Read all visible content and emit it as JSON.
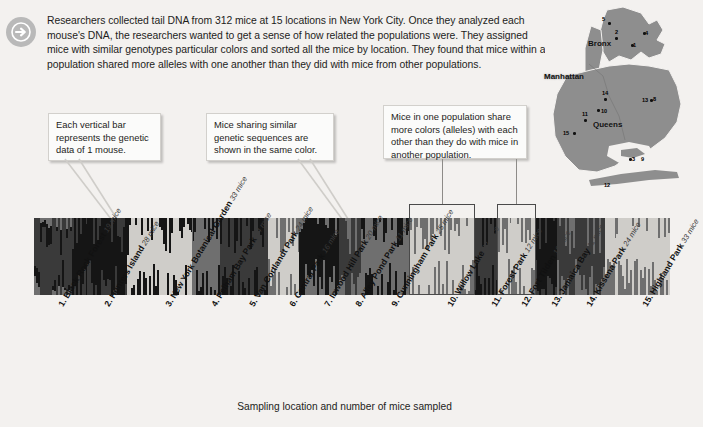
{
  "intro": {
    "icon": "arrow-right-circle-icon",
    "text": "Researchers collected tail DNA from 312 mice at 15 locations in New York City. Once they analyzed each mouse's DNA, the researchers wanted to get a sense of how related the populations were. They assigned mice with similar genotypes particular colors and sorted all the mice by location. They found that mice within a population shared more alleles with one another than they did with mice from other populations."
  },
  "callouts": [
    {
      "id": "callout-vertical-bar",
      "text": "Each vertical bar represents the genetic data of 1 mouse."
    },
    {
      "id": "callout-same-color",
      "text": "Mice sharing similar genetic sequences are shown in the same color."
    },
    {
      "id": "callout-shared-alleles",
      "text": "Mice in one population share more colors (alleles) with each other than they do with mice in another population."
    }
  ],
  "map": {
    "name": "new-york-city-map",
    "boroughs": [
      "Bronx",
      "Manhattan",
      "Queens"
    ],
    "markers": [
      "5",
      "2",
      "4",
      "1",
      "14",
      "13",
      "8",
      "10",
      "11",
      "15",
      "9",
      "3",
      "12"
    ]
  },
  "axis": {
    "caption": "Sampling location and number of mice sampled"
  },
  "chart_data": {
    "type": "bar",
    "title": "",
    "subtitle": "",
    "xlabel": "Sampling location and number of mice sampled",
    "ylabel": "",
    "total_mice": 312,
    "locations_count": 15,
    "categories": [
      "1. Black Rock Forest",
      "2. Hunters Island",
      "3. New York Botanical Garden",
      "4. Pelham Bay Park",
      "5. Van Cortlandt Park",
      "6. Central Park",
      "7. Inwood Hill Park",
      "8. Alley Pond Park",
      "9. Cunningham Park",
      "10. Willow Lake",
      "11. Forest Park",
      "12. Fort Tilden",
      "13. Jamaica Bay",
      "14. Kissena Park",
      "15. Highland Park"
    ],
    "values": [
      19,
      28,
      33,
      14,
      24,
      16,
      20,
      11,
      25,
      32,
      12,
      19,
      11,
      24,
      33
    ],
    "value_labels": [
      "19 mice",
      "28 mice",
      "33 mice",
      "14 mice",
      "24 mice",
      "16 mice",
      "20 mice",
      "11 mice",
      "25 mice",
      "32 mice",
      "12 mice",
      "19 mice",
      "11 mice",
      "24 mice",
      "33 mice"
    ],
    "unit": "mice",
    "grid": false,
    "legend": "none",
    "note": "STRUCTURE-style admixture plot: each category is a population block of vertical bars, one bar per mouse; bar segments are ancestry-cluster colors",
    "palette": [
      "#cfcdc9",
      "#6f6f6f",
      "#3a3a3a",
      "#151515"
    ],
    "highlighted_populations": [
      "10. Willow Lake",
      "12. Fort Tilden"
    ],
    "blocks": [
      {
        "label": "1. Black Rock Forest",
        "mice": 19,
        "dominant": "#3a3a3a",
        "mix": [
          "#3a3a3a",
          "#151515",
          "#6f6f6f"
        ]
      },
      {
        "label": "2. Hunters Island",
        "mice": 28,
        "dominant": "#151515",
        "mix": [
          "#151515",
          "#3a3a3a"
        ]
      },
      {
        "label": "3. New York Botanical Garden",
        "mice": 33,
        "dominant": "#cfcdc9",
        "mix": [
          "#cfcdc9",
          "#151515"
        ]
      },
      {
        "label": "4. Pelham Bay Park",
        "mice": 14,
        "dominant": "#6f6f6f",
        "mix": [
          "#6f6f6f",
          "#151515"
        ]
      },
      {
        "label": "5. Van Cortlandt Park",
        "mice": 24,
        "dominant": "#3a3a3a",
        "mix": [
          "#3a3a3a",
          "#151515"
        ]
      },
      {
        "label": "6. Central Park",
        "mice": 16,
        "dominant": "#cfcdc9",
        "mix": [
          "#cfcdc9",
          "#6f6f6f"
        ]
      },
      {
        "label": "7. Inwood Hill Park",
        "mice": 20,
        "dominant": "#151515",
        "mix": [
          "#151515",
          "#6f6f6f"
        ]
      },
      {
        "label": "8. Alley Pond Park",
        "mice": 11,
        "dominant": "#3a3a3a",
        "mix": [
          "#3a3a3a",
          "#6f6f6f"
        ]
      },
      {
        "label": "9. Cunningham Park",
        "mice": 25,
        "dominant": "#6f6f6f",
        "mix": [
          "#6f6f6f",
          "#151515"
        ]
      },
      {
        "label": "10. Willow Lake",
        "mice": 32,
        "dominant": "#cfcdc9",
        "mix": [
          "#cfcdc9",
          "#6f6f6f"
        ]
      },
      {
        "label": "11. Forest Park",
        "mice": 12,
        "dominant": "#3a3a3a",
        "mix": [
          "#3a3a3a",
          "#151515"
        ]
      },
      {
        "label": "12. Fort Tilden",
        "mice": 19,
        "dominant": "#cfcdc9",
        "mix": [
          "#cfcdc9",
          "#6f6f6f"
        ]
      },
      {
        "label": "13. Jamaica Bay",
        "mice": 11,
        "dominant": "#151515",
        "mix": [
          "#151515",
          "#3a3a3a"
        ]
      },
      {
        "label": "14. Kissena Park",
        "mice": 24,
        "dominant": "#3a3a3a",
        "mix": [
          "#3a3a3a",
          "#6f6f6f"
        ]
      },
      {
        "label": "15. Highland Park",
        "mice": 33,
        "dominant": "#cfcdc9",
        "mix": [
          "#cfcdc9",
          "#6f6f6f"
        ]
      }
    ]
  }
}
